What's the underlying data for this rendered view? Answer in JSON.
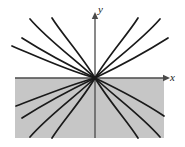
{
  "figure": {
    "title": "",
    "caption": "",
    "background_color": "#ffffff",
    "curve_color": "#1a1a1a",
    "axis_color": "#4a4a4a",
    "shaded_region_color": "#c6c6c6",
    "shaded_region_label": "shaded half-plane region below the x-axis",
    "origin": {
      "x": 95,
      "y": 78
    }
  },
  "axes": {
    "x_axis": {
      "label": "x",
      "label_position": {
        "x": 170,
        "y": 81
      },
      "line": {
        "x1": 15,
        "y1": 78,
        "x2": 163,
        "y2": 78
      },
      "arrow": "right"
    },
    "y_axis": {
      "label": "y",
      "label_position": {
        "x": 98,
        "y": 13
      },
      "line": {
        "x1": 95,
        "y1": 138,
        "x2": 95,
        "y2": 19
      },
      "arrow": "up"
    }
  },
  "shaded_region": {
    "x": 15,
    "y": 78,
    "width": 149,
    "height": 60
  },
  "chart_data": {
    "type": "line",
    "title": "",
    "xlabel": "x",
    "ylabel": "y",
    "grid": false,
    "legend": "none",
    "xlim": [
      -80,
      68
    ],
    "ylim": [
      -60,
      59
    ],
    "series": [
      {
        "name": "curve-upper-left-steep",
        "path": "M 95 78 C 82 56 62 34 52 18"
      },
      {
        "name": "curve-upper-left-mid",
        "path": "M 95 78 C 76 60 48 40 30 19"
      },
      {
        "name": "curve-upper-left-shallow",
        "path": "M 95 78 C 70 66 44 52 22 38"
      },
      {
        "name": "curve-upper-left-flat",
        "path": "M 95 78 C 66 70 36 56 12 46"
      },
      {
        "name": "curve-upper-right-steep",
        "path": "M 95 78 C 108 56 128 34 138 18"
      },
      {
        "name": "curve-upper-right-mid",
        "path": "M 95 78 C 114 60 142 40 160 19"
      },
      {
        "name": "curve-upper-right-shallow",
        "path": "M 95 78 C 120 66 146 52 168 38"
      },
      {
        "name": "curve-lower-left-steep",
        "path": "M 95 78 C 82 100 62 122 52 138"
      },
      {
        "name": "curve-lower-left-mid",
        "path": "M 95 78 C 76 96 48 116 30 137"
      },
      {
        "name": "curve-lower-left-shallow",
        "path": "M 95 78 C 70 90 44 104 22 118"
      },
      {
        "name": "curve-lower-left-flat",
        "path": "M 95 78 C 66 86 38 98 16 106"
      },
      {
        "name": "curve-lower-right-steep",
        "path": "M 95 78 C 108 100 128 122 138 138"
      },
      {
        "name": "curve-lower-right-mid",
        "path": "M 95 78 C 114 96 142 116 160 137"
      },
      {
        "name": "curve-lower-right-shallow",
        "path": "M 95 78 C 120 90 146 104 164 116"
      }
    ]
  }
}
